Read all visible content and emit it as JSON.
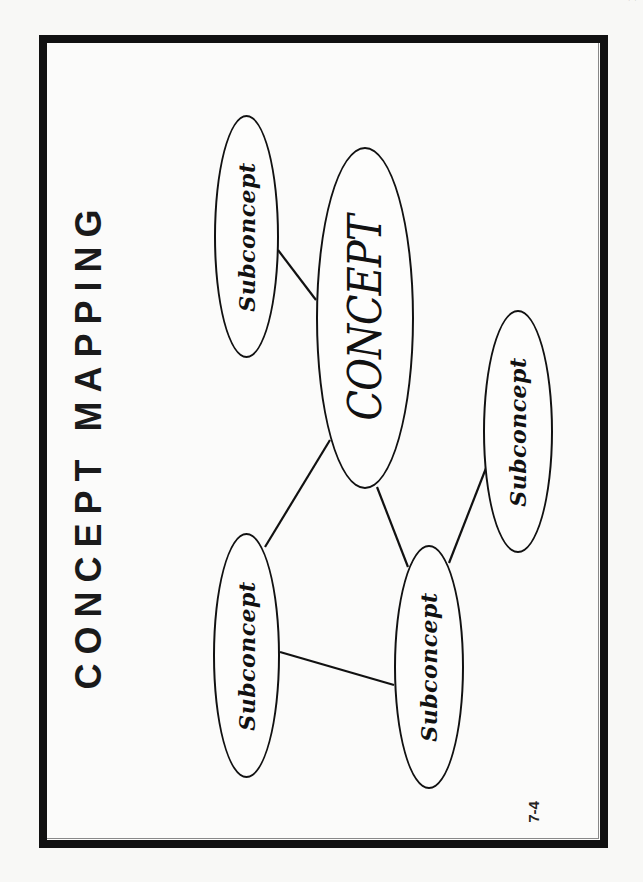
{
  "header": {
    "corner_fragment": "· ·"
  },
  "slide": {
    "title": "CONCEPT MAPPING",
    "page_number": "7-4"
  },
  "diagram": {
    "nodes": [
      {
        "id": "concept",
        "label": "CONCEPT",
        "type": "main"
      },
      {
        "id": "sub-top",
        "label": "Subconcept",
        "type": "sub"
      },
      {
        "id": "sub-bottom-left",
        "label": "Subconcept",
        "type": "sub"
      },
      {
        "id": "sub-bottom-middle",
        "label": "Subconcept",
        "type": "sub"
      },
      {
        "id": "sub-right",
        "label": "Subconcept",
        "type": "sub"
      }
    ],
    "edges": [
      [
        "sub-top",
        "concept"
      ],
      [
        "concept",
        "sub-bottom-left"
      ],
      [
        "concept",
        "sub-bottom-middle"
      ],
      [
        "sub-bottom-left",
        "sub-bottom-middle"
      ],
      [
        "sub-bottom-middle",
        "sub-right"
      ]
    ]
  },
  "colors": {
    "ink": "#111111",
    "paper": "#f8f8f6"
  }
}
